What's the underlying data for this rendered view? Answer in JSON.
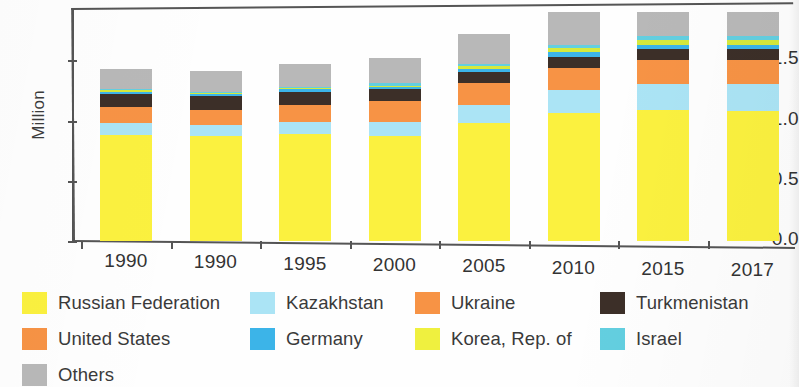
{
  "chart_data": {
    "type": "bar",
    "stacked": true,
    "title": "",
    "xlabel": "",
    "ylabel": "Million",
    "ylim": [
      0.0,
      2.0
    ],
    "yticks": [
      "0.0",
      "0.5",
      "1.0",
      "1.5"
    ],
    "ytick_values": [
      0.0,
      0.5,
      1.0,
      1.5
    ],
    "grid": false,
    "legend_position": "bottom",
    "categories": [
      "1990",
      "1990",
      "1995",
      "2000",
      "2005",
      "2010",
      "2015",
      "2017"
    ],
    "series": [
      {
        "name": "Russian Federation",
        "color": "#fbf13f",
        "values": [
          0.88,
          0.87,
          0.89,
          0.87,
          0.98,
          1.06,
          1.09,
          1.08
        ]
      },
      {
        "name": "Kazakhstan",
        "color": "#abe4f5",
        "values": [
          0.1,
          0.09,
          0.1,
          0.12,
          0.15,
          0.19,
          0.21,
          0.22
        ]
      },
      {
        "name": "Ukraine",
        "color": "#f79345",
        "values": [
          0.13,
          0.13,
          0.14,
          0.17,
          0.18,
          0.19,
          0.2,
          0.2
        ]
      },
      {
        "name": "Turkmenistan",
        "color": "#3c2f28",
        "values": [
          0.11,
          0.11,
          0.11,
          0.1,
          0.09,
          0.09,
          0.09,
          0.09
        ]
      },
      {
        "name": "Germany",
        "color": "#3cb4e8",
        "values": [
          0.02,
          0.02,
          0.02,
          0.02,
          0.03,
          0.04,
          0.04,
          0.04
        ]
      },
      {
        "name": "Korea, Rep. of",
        "color": "#d6e93c",
        "values": [
          0.01,
          0.01,
          0.01,
          0.01,
          0.02,
          0.03,
          0.04,
          0.04
        ]
      },
      {
        "name": "Israel",
        "color": "#63cfe0",
        "values": [
          0.01,
          0.01,
          0.01,
          0.02,
          0.02,
          0.03,
          0.03,
          0.03
        ]
      },
      {
        "name": "Others",
        "color": "#b8b8b8",
        "values": [
          0.17,
          0.17,
          0.19,
          0.21,
          0.25,
          0.27,
          0.2,
          0.2
        ]
      }
    ],
    "totals": [
      1.43,
      1.41,
      1.47,
      1.52,
      1.72,
      1.9,
      1.9,
      1.9
    ]
  },
  "legend": {
    "entries": [
      {
        "label": "Russian Federation",
        "color": "#fbf13f"
      },
      {
        "label": "Kazakhstan",
        "color": "#abe4f5"
      },
      {
        "label": "Ukraine",
        "color": "#f79345"
      },
      {
        "label": "Turkmenistan",
        "color": "#3c2f28"
      },
      {
        "label": "United States",
        "color": "#f79345"
      },
      {
        "label": "Germany",
        "color": "#3cb4e8"
      },
      {
        "label": "Korea, Rep. of",
        "color": "#eff03f"
      },
      {
        "label": "Israel",
        "color": "#63cfe0"
      },
      {
        "label": "Others",
        "color": "#b8b8b8"
      }
    ]
  }
}
